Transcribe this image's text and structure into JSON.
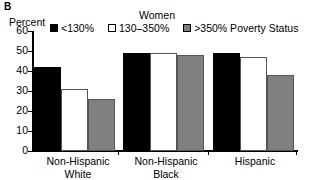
{
  "panel": {
    "letter": "B"
  },
  "header": {
    "group_title": "Women"
  },
  "legend": {
    "items": [
      {
        "label": "<130%",
        "swatch": "black",
        "color": "#000000"
      },
      {
        "label": "130–350%",
        "swatch": "white",
        "color": "#FFFFFF"
      },
      {
        "label": ">350% Poverty Status",
        "swatch": "gray",
        "color": "#808080"
      }
    ]
  },
  "axes": {
    "ylabel": "Percent",
    "yticks": [
      "0",
      "10",
      "20",
      "30",
      "40",
      "50",
      "60"
    ]
  },
  "chart_data": {
    "type": "bar",
    "title": "Women",
    "xlabel": "",
    "ylabel": "Percent",
    "ylim": [
      0,
      60
    ],
    "yticks": [
      0,
      10,
      20,
      30,
      40,
      50,
      60
    ],
    "grid": false,
    "legend_position": "top",
    "categories": [
      "Non-Hispanic White",
      "Non-Hispanic Black",
      "Hispanic"
    ],
    "series": [
      {
        "name": "<130%",
        "color": "#000000",
        "values": [
          42,
          49,
          49
        ]
      },
      {
        "name": "130–350%",
        "color": "#FFFFFF",
        "values": [
          31,
          49,
          47
        ]
      },
      {
        "name": ">350% Poverty Status",
        "color": "#808080",
        "values": [
          26,
          48,
          38
        ]
      }
    ]
  }
}
